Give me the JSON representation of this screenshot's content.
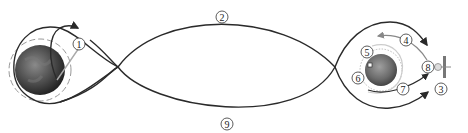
{
  "diagram": {
    "type": "lunar mission trajectory",
    "bodies": [
      {
        "name": "earth",
        "cx": 40,
        "cy": 70,
        "r": 25
      },
      {
        "name": "moon",
        "cx": 381,
        "cy": 70,
        "r": 16
      }
    ],
    "labels": [
      {
        "id": "1",
        "text": "1",
        "x": 79,
        "y": 44
      },
      {
        "id": "2",
        "text": "2",
        "x": 222,
        "y": 17
      },
      {
        "id": "3",
        "text": "3",
        "x": 441,
        "y": 89
      },
      {
        "id": "4",
        "text": "4",
        "x": 406,
        "y": 40
      },
      {
        "id": "5",
        "text": "5",
        "x": 367,
        "y": 52
      },
      {
        "id": "6",
        "text": "6",
        "x": 358,
        "y": 78
      },
      {
        "id": "7",
        "text": "7",
        "x": 403,
        "y": 89
      },
      {
        "id": "8",
        "text": "8",
        "x": 428,
        "y": 67
      },
      {
        "id": "9",
        "text": "9",
        "x": 227,
        "y": 124
      }
    ],
    "colors": {
      "line": "#2a2a2a",
      "orbit": "#888888",
      "earth": "#4a4a4a",
      "moon": "#6b6b6b"
    }
  }
}
